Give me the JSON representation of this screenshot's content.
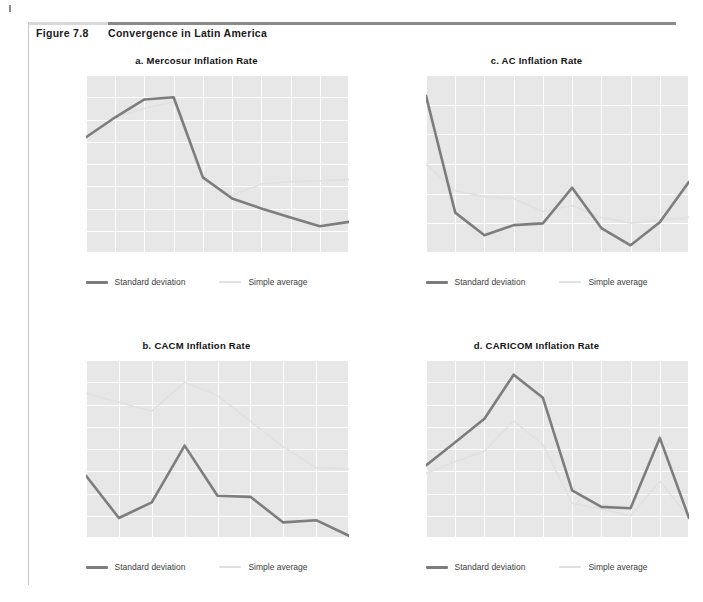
{
  "figure": {
    "number": "Figure 7.8",
    "title": "Convergence in Latin America"
  },
  "legend": {
    "std_label": "Standard deviation",
    "avg_label": "Simple average",
    "std_color": "#7d7d7d",
    "avg_color": "#e0e0e0"
  },
  "style": {
    "plot_bg": "#e7e7e7",
    "grid_color": "#ffffff",
    "tick_color": "#4a4a4a"
  },
  "chart_data": [
    {
      "id": "mercosur",
      "type": "line",
      "title": "a. Mercosur Inflation Rate",
      "xlabel": "",
      "ylabel": "",
      "categories": [
        "1991",
        "92",
        "93",
        "94",
        "95",
        "96",
        "97",
        "98",
        "99",
        "2000"
      ],
      "ylim": [
        0.0,
        8.0
      ],
      "yticks": [
        "0.0",
        "1.0",
        "2.0",
        "3.0",
        "4.0",
        "5.0",
        "6.0",
        "7.0",
        "8.0"
      ],
      "ytickvals": [
        0.0,
        1.0,
        2.0,
        3.0,
        4.0,
        5.0,
        6.0,
        7.0,
        8.0
      ],
      "grid": true,
      "legend_position": "bottom",
      "series": [
        {
          "name": "Standard deviation",
          "values": [
            5.2,
            6.1,
            6.9,
            7.0,
            3.4,
            2.45,
            2.0,
            1.6,
            1.2,
            1.4
          ]
        },
        {
          "name": "Simple average",
          "values": [
            5.2,
            6.1,
            6.5,
            6.8,
            3.3,
            2.6,
            3.1,
            3.2,
            3.25,
            3.3
          ]
        }
      ]
    },
    {
      "id": "ac",
      "type": "line",
      "title": "c. AC Inflation Rate",
      "xlabel": "",
      "ylabel": "",
      "categories": [
        "1991",
        "92",
        "93",
        "94",
        "95",
        "96",
        "97",
        "98",
        "99",
        "2000"
      ],
      "ylim": [
        2.5,
        5.5
      ],
      "yticks": [
        "2.5",
        "3.0",
        "3.5",
        "4.0",
        "4.5",
        "5.0",
        "5.5"
      ],
      "ytickvals": [
        2.5,
        3.0,
        3.5,
        4.0,
        4.5,
        5.0,
        5.5
      ],
      "grid": true,
      "legend_position": "bottom",
      "series": [
        {
          "name": "Standard deviation",
          "values": [
            5.15,
            3.18,
            2.8,
            2.97,
            3.0,
            3.6,
            2.92,
            2.63,
            3.02,
            3.7
          ]
        },
        {
          "name": "Simple average",
          "values": [
            4.0,
            3.55,
            3.45,
            3.42,
            3.2,
            3.3,
            3.1,
            3.0,
            3.05,
            3.1
          ]
        }
      ]
    },
    {
      "id": "cacm",
      "type": "line",
      "title": "b. CACM Inflation Rate",
      "xlabel": "",
      "ylabel": "",
      "categories": [
        "1992",
        "93",
        "94",
        "95",
        "96",
        "97",
        "98",
        "99",
        "2000"
      ],
      "ylim": [
        1.4,
        3.0
      ],
      "yticks": [
        "1.4",
        "1.6",
        "1.8",
        "2.0",
        "2.2",
        "2.4",
        "2.6",
        "2.8",
        "3.0"
      ],
      "ytickvals": [
        1.4,
        1.6,
        1.8,
        2.0,
        2.2,
        2.4,
        2.6,
        2.8,
        3.0
      ],
      "grid": true,
      "legend_position": "bottom",
      "series": [
        {
          "name": "Standard deviation",
          "values": [
            1.96,
            1.58,
            1.72,
            2.23,
            1.78,
            1.77,
            1.54,
            1.56,
            1.42
          ]
        },
        {
          "name": "Simple average",
          "values": [
            2.7,
            2.62,
            2.54,
            2.8,
            2.68,
            2.45,
            2.22,
            2.03,
            2.02
          ]
        }
      ]
    },
    {
      "id": "caricom",
      "type": "line",
      "title": "d. CARICOM Inflation Rate",
      "xlabel": "",
      "ylabel": "",
      "categories": [
        "1991",
        "92",
        "93",
        "94",
        "95",
        "96",
        "97",
        "98",
        "99",
        "2000"
      ],
      "ylim": [
        1.0,
        5.0
      ],
      "yticks": [
        "1.0",
        "1.5",
        "2.0",
        "2.5",
        "3.0",
        "3.5",
        "4.0",
        "4.5",
        "5.0"
      ],
      "ytickvals": [
        1.0,
        1.5,
        2.0,
        2.5,
        3.0,
        3.5,
        4.0,
        4.5,
        5.0
      ],
      "grid": true,
      "legend_position": "bottom",
      "series": [
        {
          "name": "Standard deviation",
          "values": [
            2.63,
            3.15,
            3.68,
            4.67,
            4.15,
            2.07,
            1.7,
            1.67,
            3.25,
            1.45
          ]
        },
        {
          "name": "Simple average",
          "values": [
            2.45,
            2.72,
            2.95,
            3.63,
            3.1,
            1.78,
            1.65,
            1.5,
            2.28,
            1.45
          ]
        }
      ]
    }
  ]
}
